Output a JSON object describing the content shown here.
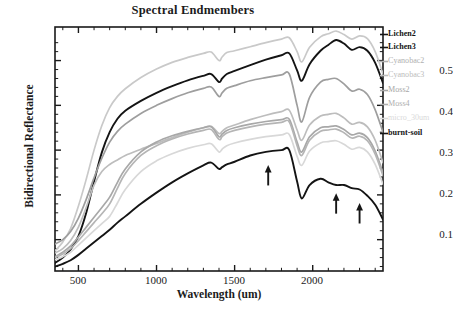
{
  "chart_data": {
    "type": "line",
    "title": "Spectral Endmembers",
    "xlabel": "Wavelength (um)",
    "ylabel": "Bidirectional Reflectance",
    "xlim": [
      350,
      2450
    ],
    "ylim": [
      0.03,
      0.575
    ],
    "xticks": [
      500,
      1000,
      1500,
      2000
    ],
    "yticks": [
      0.1,
      0.2,
      0.3,
      0.4,
      0.5
    ],
    "xtick_labels": [
      "500",
      "1000",
      "1500",
      "2000"
    ],
    "ytick_labels": [
      "0.1",
      "0.2",
      "0.3",
      "0.4",
      "0.5"
    ],
    "grid": false,
    "legend_position": "right-outside",
    "x": [
      350,
      400,
      450,
      500,
      550,
      600,
      650,
      700,
      750,
      800,
      900,
      1000,
      1100,
      1200,
      1300,
      1350,
      1400,
      1420,
      1450,
      1500,
      1600,
      1700,
      1800,
      1850,
      1900,
      1930,
      1980,
      2050,
      2100,
      2150,
      2200,
      2250,
      2300,
      2350,
      2400,
      2450
    ],
    "series": [
      {
        "name": "Lichen2",
        "color": "#c9c9c9",
        "values": [
          0.075,
          0.095,
          0.125,
          0.175,
          0.235,
          0.3,
          0.355,
          0.395,
          0.42,
          0.437,
          0.462,
          0.481,
          0.496,
          0.507,
          0.516,
          0.519,
          0.5,
          0.508,
          0.518,
          0.522,
          0.531,
          0.54,
          0.548,
          0.551,
          0.52,
          0.497,
          0.53,
          0.553,
          0.56,
          0.566,
          0.558,
          0.548,
          0.555,
          0.549,
          0.52,
          0.47
        ]
      },
      {
        "name": "Lichen3",
        "color": "#141414",
        "values": [
          0.048,
          0.06,
          0.078,
          0.108,
          0.16,
          0.23,
          0.295,
          0.34,
          0.37,
          0.388,
          0.41,
          0.428,
          0.443,
          0.456,
          0.466,
          0.47,
          0.452,
          0.46,
          0.47,
          0.477,
          0.49,
          0.502,
          0.512,
          0.516,
          0.478,
          0.455,
          0.492,
          0.522,
          0.535,
          0.546,
          0.538,
          0.524,
          0.53,
          0.522,
          0.495,
          0.45
        ]
      },
      {
        "name": "Cyanobac2",
        "color": "#9e9e9e",
        "values": [
          0.09,
          0.1,
          0.118,
          0.148,
          0.19,
          0.238,
          0.282,
          0.318,
          0.342,
          0.358,
          0.382,
          0.4,
          0.415,
          0.428,
          0.438,
          0.441,
          0.42,
          0.428,
          0.438,
          0.444,
          0.455,
          0.462,
          0.468,
          0.47,
          0.4,
          0.363,
          0.418,
          0.452,
          0.458,
          0.46,
          0.448,
          0.432,
          0.436,
          0.424,
          0.39,
          0.34
        ]
      },
      {
        "name": "Cyanobac3",
        "color": "#bdbdbd",
        "values": [
          0.07,
          0.08,
          0.098,
          0.128,
          0.172,
          0.222,
          0.252,
          0.268,
          0.278,
          0.288,
          0.302,
          0.315,
          0.328,
          0.34,
          0.35,
          0.353,
          0.337,
          0.342,
          0.35,
          0.356,
          0.368,
          0.378,
          0.386,
          0.389,
          0.345,
          0.322,
          0.356,
          0.376,
          0.38,
          0.382,
          0.372,
          0.358,
          0.362,
          0.352,
          0.322,
          0.272
        ]
      },
      {
        "name": "Moss2",
        "color": "#a8a8a8",
        "values": [
          0.062,
          0.072,
          0.086,
          0.106,
          0.128,
          0.15,
          0.172,
          0.195,
          0.228,
          0.258,
          0.296,
          0.318,
          0.332,
          0.342,
          0.35,
          0.352,
          0.33,
          0.336,
          0.344,
          0.35,
          0.358,
          0.364,
          0.368,
          0.369,
          0.318,
          0.296,
          0.33,
          0.35,
          0.352,
          0.354,
          0.346,
          0.334,
          0.338,
          0.328,
          0.298,
          0.25
        ]
      },
      {
        "name": "Moss4",
        "color": "#b5b5b5",
        "values": [
          0.06,
          0.068,
          0.08,
          0.098,
          0.118,
          0.138,
          0.158,
          0.18,
          0.215,
          0.248,
          0.288,
          0.31,
          0.325,
          0.336,
          0.344,
          0.346,
          0.324,
          0.33,
          0.338,
          0.344,
          0.352,
          0.358,
          0.362,
          0.363,
          0.31,
          0.288,
          0.322,
          0.342,
          0.345,
          0.347,
          0.339,
          0.327,
          0.331,
          0.321,
          0.291,
          0.243
        ]
      },
      {
        "name": "micro_30um",
        "color": "#d8d8d8",
        "values": [
          0.055,
          0.062,
          0.072,
          0.088,
          0.104,
          0.12,
          0.136,
          0.152,
          0.182,
          0.212,
          0.252,
          0.276,
          0.292,
          0.304,
          0.312,
          0.314,
          0.296,
          0.302,
          0.31,
          0.316,
          0.324,
          0.33,
          0.334,
          0.335,
          0.286,
          0.266,
          0.298,
          0.316,
          0.319,
          0.321,
          0.313,
          0.302,
          0.306,
          0.296,
          0.268,
          0.224
        ]
      },
      {
        "name": "burnt-soil",
        "color": "#141414",
        "values": [
          0.04,
          0.046,
          0.054,
          0.066,
          0.08,
          0.094,
          0.108,
          0.122,
          0.138,
          0.152,
          0.18,
          0.205,
          0.228,
          0.248,
          0.266,
          0.272,
          0.258,
          0.262,
          0.268,
          0.274,
          0.288,
          0.296,
          0.3,
          0.3,
          0.23,
          0.192,
          0.222,
          0.236,
          0.228,
          0.222,
          0.222,
          0.215,
          0.212,
          0.198,
          0.178,
          0.145
        ]
      }
    ],
    "annotations": [
      {
        "label": "arrow-1",
        "x": 1715,
        "y": 0.268,
        "direction": "up"
      },
      {
        "label": "arrow-2",
        "x": 2150,
        "y": 0.205,
        "direction": "up"
      },
      {
        "label": "arrow-3",
        "x": 2300,
        "y": 0.183,
        "direction": "up"
      }
    ]
  },
  "legend": {
    "entries": [
      {
        "label": "Lichen2",
        "bold": true,
        "color": "#141414",
        "top": 30
      },
      {
        "label": "Lichen3",
        "bold": true,
        "color": "#141414",
        "top": 43
      },
      {
        "label": "Cyanobac2",
        "bold": false,
        "color": "#b0b0b0",
        "top": 57
      },
      {
        "label": "Cyanobac3",
        "bold": false,
        "color": "#bcbcbc",
        "top": 71
      },
      {
        "label": "Moss2",
        "bold": false,
        "color": "#a6a6a6",
        "top": 86
      },
      {
        "label": "Moss4",
        "bold": false,
        "color": "#aeaeae",
        "top": 100
      },
      {
        "label": "micro_30um",
        "bold": false,
        "color": "#dadada",
        "top": 114
      },
      {
        "label": "burnt-soil",
        "bold": true,
        "color": "#141414",
        "top": 129
      }
    ]
  }
}
